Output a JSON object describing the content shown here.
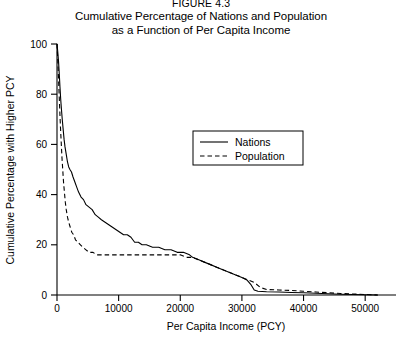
{
  "figure": {
    "number": "FIGURE 4.3",
    "title_line1": "Cumulative Percentage of Nations and Population",
    "title_line2": "as a Function of Per Capita Income"
  },
  "chart_data": {
    "type": "line",
    "title": "Cumulative Percentage of Nations and Population as a Function of Per Capita Income",
    "xlabel": "Per Capita Income (PCY)",
    "ylabel": "Cumulative Percentage with Higher PCY",
    "xlim": [
      0,
      55000
    ],
    "ylim": [
      0,
      100
    ],
    "xticks": [
      0,
      10000,
      20000,
      30000,
      40000,
      50000
    ],
    "xtick_labels": [
      "0",
      "10000",
      "20000",
      "30000",
      "40000",
      "50000"
    ],
    "yticks": [
      0,
      20,
      40,
      60,
      80,
      100
    ],
    "ytick_labels": [
      "0",
      "20",
      "40",
      "60",
      "80",
      "100"
    ],
    "grid": false,
    "legend_position": "upper-center-right",
    "series": [
      {
        "name": "Nations",
        "style": "solid",
        "color": "#000000",
        "points": [
          [
            0,
            100
          ],
          [
            120,
            97
          ],
          [
            250,
            93
          ],
          [
            370,
            88
          ],
          [
            480,
            83
          ],
          [
            600,
            78
          ],
          [
            720,
            74
          ],
          [
            850,
            70
          ],
          [
            1000,
            66
          ],
          [
            1150,
            62
          ],
          [
            1300,
            59
          ],
          [
            1500,
            56
          ],
          [
            1700,
            53
          ],
          [
            1900,
            51
          ],
          [
            2100,
            50
          ],
          [
            2350,
            49
          ],
          [
            2600,
            47
          ],
          [
            2900,
            45
          ],
          [
            3200,
            43
          ],
          [
            3500,
            41
          ],
          [
            3900,
            39
          ],
          [
            4300,
            38
          ],
          [
            4700,
            36
          ],
          [
            5200,
            35
          ],
          [
            5700,
            34
          ],
          [
            6200,
            32
          ],
          [
            6700,
            31
          ],
          [
            7200,
            30
          ],
          [
            7800,
            29
          ],
          [
            8400,
            28
          ],
          [
            9000,
            27
          ],
          [
            9600,
            26
          ],
          [
            10200,
            25
          ],
          [
            10800,
            24
          ],
          [
            11400,
            24
          ],
          [
            12000,
            23
          ],
          [
            12600,
            21
          ],
          [
            13200,
            21
          ],
          [
            13800,
            20
          ],
          [
            14500,
            20
          ],
          [
            15500,
            19
          ],
          [
            16500,
            19
          ],
          [
            17500,
            18
          ],
          [
            18500,
            18
          ],
          [
            19500,
            17
          ],
          [
            20500,
            17
          ],
          [
            21500,
            16
          ],
          [
            22000,
            15
          ],
          [
            23000,
            14
          ],
          [
            24000,
            13
          ],
          [
            25000,
            12
          ],
          [
            26000,
            11
          ],
          [
            27000,
            10
          ],
          [
            28000,
            9
          ],
          [
            29000,
            8
          ],
          [
            30000,
            7
          ],
          [
            30800,
            6
          ],
          [
            31500,
            4
          ],
          [
            32000,
            2
          ],
          [
            32600,
            1.5
          ],
          [
            34000,
            1.3
          ],
          [
            36000,
            1.2
          ],
          [
            38000,
            1.0
          ],
          [
            40000,
            0.9
          ],
          [
            42000,
            0.7
          ],
          [
            44000,
            0.5
          ],
          [
            46000,
            0.3
          ],
          [
            48000,
            0.2
          ],
          [
            50000,
            0.1
          ],
          [
            52000,
            0
          ]
        ]
      },
      {
        "name": "Population",
        "style": "dashed",
        "color": "#000000",
        "points": [
          [
            0,
            100
          ],
          [
            100,
            95
          ],
          [
            220,
            88
          ],
          [
            330,
            81
          ],
          [
            440,
            74
          ],
          [
            560,
            67
          ],
          [
            680,
            61
          ],
          [
            800,
            55
          ],
          [
            930,
            50
          ],
          [
            1060,
            45
          ],
          [
            1200,
            41
          ],
          [
            1350,
            37
          ],
          [
            1500,
            34
          ],
          [
            1700,
            31
          ],
          [
            1900,
            29
          ],
          [
            2150,
            27
          ],
          [
            2400,
            25
          ],
          [
            2700,
            24
          ],
          [
            3000,
            22
          ],
          [
            3400,
            21
          ],
          [
            3800,
            20
          ],
          [
            4200,
            19
          ],
          [
            4700,
            18
          ],
          [
            5200,
            17
          ],
          [
            5800,
            17
          ],
          [
            6500,
            16
          ],
          [
            7200,
            16
          ],
          [
            8000,
            16
          ],
          [
            9000,
            16
          ],
          [
            10000,
            16
          ],
          [
            11000,
            16
          ],
          [
            12000,
            16
          ],
          [
            13000,
            16
          ],
          [
            14000,
            16
          ],
          [
            15000,
            16
          ],
          [
            16000,
            16
          ],
          [
            17000,
            16
          ],
          [
            18000,
            16
          ],
          [
            19000,
            16
          ],
          [
            20000,
            16
          ],
          [
            21000,
            15
          ],
          [
            22000,
            15
          ],
          [
            23000,
            14
          ],
          [
            24000,
            13
          ],
          [
            25000,
            12
          ],
          [
            26000,
            11
          ],
          [
            27000,
            10
          ],
          [
            28000,
            9
          ],
          [
            29000,
            8
          ],
          [
            30000,
            7
          ],
          [
            31000,
            6
          ],
          [
            32000,
            5
          ],
          [
            33000,
            3
          ],
          [
            34000,
            2.2
          ],
          [
            36000,
            2.0
          ],
          [
            38000,
            1.8
          ],
          [
            40000,
            1.5
          ],
          [
            42000,
            1.2
          ],
          [
            44000,
            0.9
          ],
          [
            46000,
            0.6
          ],
          [
            48000,
            0.4
          ],
          [
            50000,
            0.2
          ],
          [
            52000,
            0
          ]
        ]
      }
    ]
  },
  "legend": {
    "entries": [
      {
        "label": "Nations"
      },
      {
        "label": "Population"
      }
    ]
  }
}
